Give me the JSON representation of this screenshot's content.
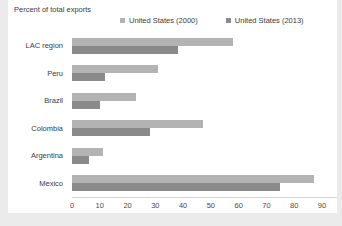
{
  "title": "Percent of total exports",
  "legend": [
    {
      "label": "United States (2000)",
      "color": "#b3b3b3"
    },
    {
      "label": "United States (2013)",
      "color": "#8a8a8a"
    }
  ],
  "colors": {
    "series_2000": "#b3b3b3",
    "series_2013": "#8a8a8a",
    "axis_line": "#d6d6d6",
    "text": "#3a3a3a",
    "frame_border": "#ebebeb",
    "background": "#ffffff"
  },
  "chart_data": {
    "type": "bar",
    "orientation": "horizontal",
    "title": "Percent of total exports",
    "xlabel": "",
    "ylabel": "",
    "categories": [
      "LAC region",
      "Peru",
      "Brazil",
      "Colombia",
      "Argentina",
      "Mexico"
    ],
    "series": [
      {
        "name": "United States (2000)",
        "color": "#b3b3b3",
        "values": [
          58,
          31,
          23,
          47,
          11,
          87
        ]
      },
      {
        "name": "United States (2013)",
        "color": "#8a8a8a",
        "values": [
          38,
          12,
          10,
          28,
          6,
          75
        ]
      }
    ],
    "xlim": [
      0,
      90
    ],
    "xticks": [
      0,
      10,
      20,
      30,
      40,
      50,
      60,
      70,
      80,
      90
    ],
    "grid": false,
    "legend_position": "top"
  }
}
